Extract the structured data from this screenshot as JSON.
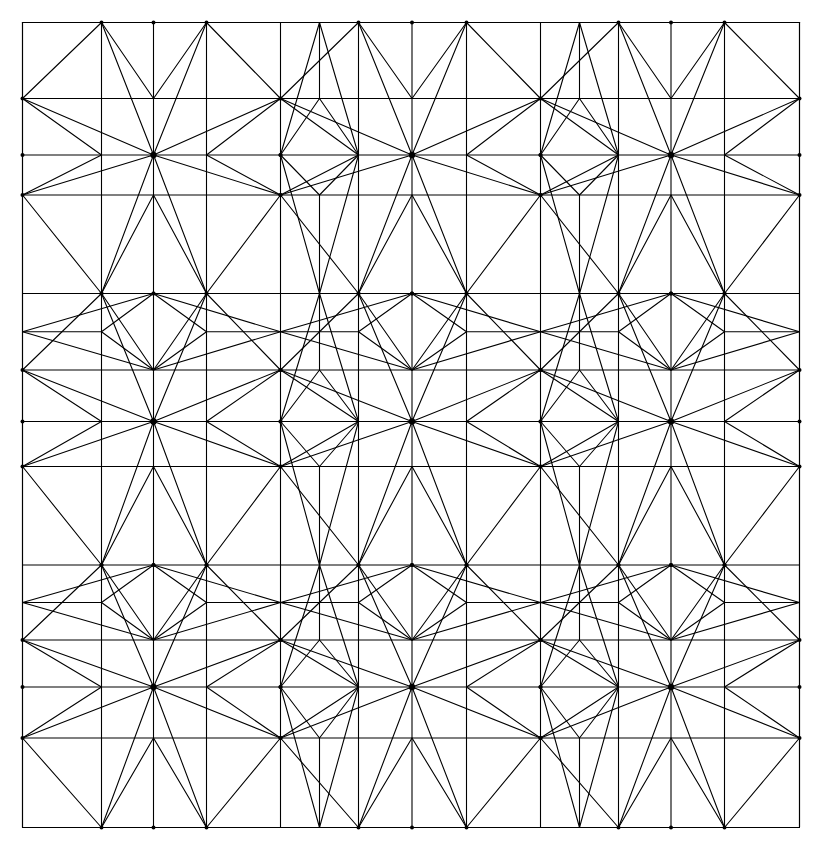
{
  "figure": {
    "type": "geometric-tiling-diagram",
    "caption": "",
    "background_color": "#ffffff",
    "stroke_color": "#000000",
    "stroke_width": 1.1,
    "canvas": {
      "width": 823,
      "height": 861
    }
  },
  "geometry": {
    "frame": {
      "x0": 22.5,
      "y0": 22.5,
      "x1": 799.5,
      "y1": 827.5
    },
    "grid": {
      "vertical_lines": [
        22.5,
        101.5,
        206.5,
        280.5,
        358.5,
        466.5,
        540.5,
        618.5,
        724.5,
        799.5
      ],
      "horizontal_lines": [
        22.5,
        98.5,
        195.0,
        293.5,
        370.0,
        466.5,
        565.0,
        640.0,
        738.0,
        827.5
      ]
    },
    "star_centers_x": [
      153.5,
      412.0,
      671.0
    ],
    "star_centers_y": [
      155.0,
      421.5,
      687.0
    ],
    "star": {
      "rays": 12,
      "description": "twelve-point rosette with rays to surrounding lattice nodes"
    },
    "cell_period_x": 259.0,
    "cell_period_y": 266.0,
    "counts": {
      "stars": 9,
      "rows": 3,
      "columns": 3,
      "diamonds_interior": 4
    }
  },
  "chart_data": {
    "type": "diagram",
    "xlabel": "",
    "ylabel": "",
    "grid": true,
    "legend": "none",
    "categories": [
      "star-rosette",
      "square-tile",
      "diamond",
      "chevron",
      "kite"
    ],
    "values": [
      9,
      16,
      12,
      24,
      36
    ]
  }
}
